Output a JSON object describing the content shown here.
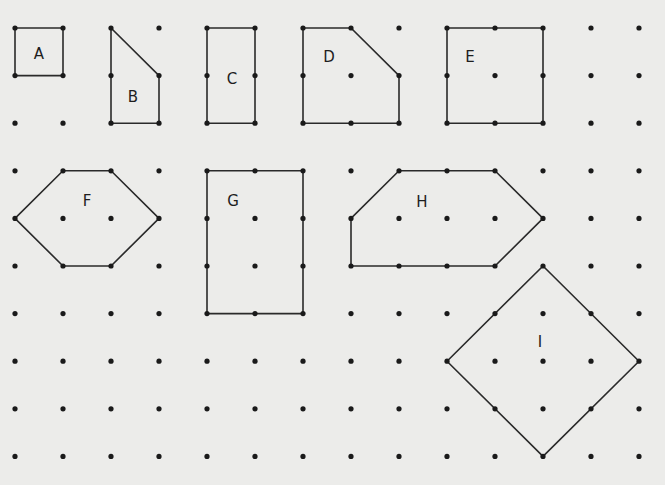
{
  "grid": {
    "columns": 14,
    "rows": 10,
    "origin_x": 15,
    "origin_y": 28,
    "step_x": 48,
    "step_y": 47.6,
    "dot_color": "#1a1a1a",
    "line_color": "#2a2a2a",
    "background": "#ececea"
  },
  "shapes": [
    {
      "label": "A",
      "vertices": [
        [
          0,
          0
        ],
        [
          1,
          0
        ],
        [
          1,
          1
        ],
        [
          0,
          1
        ]
      ],
      "label_pos": [
        39,
        54
      ]
    },
    {
      "label": "B",
      "vertices": [
        [
          2,
          0
        ],
        [
          3,
          1
        ],
        [
          3,
          2
        ],
        [
          2,
          2
        ]
      ],
      "label_pos": [
        133,
        97
      ]
    },
    {
      "label": "C",
      "vertices": [
        [
          4,
          0
        ],
        [
          5,
          0
        ],
        [
          5,
          2
        ],
        [
          4,
          2
        ]
      ],
      "label_pos": [
        232,
        79
      ]
    },
    {
      "label": "D",
      "vertices": [
        [
          6,
          0
        ],
        [
          7,
          0
        ],
        [
          8,
          1
        ],
        [
          8,
          2
        ],
        [
          6,
          2
        ]
      ],
      "label_pos": [
        329,
        57
      ]
    },
    {
      "label": "E",
      "vertices": [
        [
          9,
          0
        ],
        [
          11,
          0
        ],
        [
          11,
          2
        ],
        [
          9,
          2
        ]
      ],
      "label_pos": [
        470,
        57
      ]
    },
    {
      "label": "F",
      "vertices": [
        [
          1,
          3
        ],
        [
          2,
          3
        ],
        [
          3,
          4
        ],
        [
          2,
          5
        ],
        [
          1,
          5
        ],
        [
          0,
          4
        ]
      ],
      "label_pos": [
        87,
        201
      ]
    },
    {
      "label": "G",
      "vertices": [
        [
          4,
          3
        ],
        [
          6,
          3
        ],
        [
          6,
          6
        ],
        [
          4,
          6
        ]
      ],
      "label_pos": [
        233,
        201
      ]
    },
    {
      "label": "H",
      "vertices": [
        [
          8,
          3
        ],
        [
          10,
          3
        ],
        [
          11,
          4
        ],
        [
          10,
          5
        ],
        [
          7,
          5
        ],
        [
          7,
          4
        ]
      ],
      "label_pos": [
        422,
        202
      ]
    },
    {
      "label": "I",
      "vertices": [
        [
          11,
          5
        ],
        [
          13,
          7
        ],
        [
          11,
          9
        ],
        [
          9,
          7
        ]
      ],
      "label_pos": [
        540,
        342
      ]
    }
  ]
}
